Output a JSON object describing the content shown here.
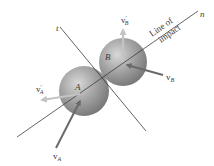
{
  "diagram": {
    "axes": {
      "n_label": "n",
      "t_label": "t",
      "line_of_impact_line1": "Line of",
      "line_of_impact_line2": "impact"
    },
    "bodies": {
      "A": {
        "label": "A",
        "color": "#8f8f8f"
      },
      "B": {
        "label": "B",
        "color": "#8f8f8f"
      }
    },
    "vectors": {
      "vA": {
        "base": "v",
        "sub": "A",
        "prime": "",
        "color": "#6a6a6a"
      },
      "vB": {
        "base": "v",
        "sub": "B",
        "prime": "",
        "color": "#6a6a6a"
      },
      "vA_prime": {
        "base": "v",
        "sub": "A",
        "prime": "′",
        "color": "#c4c4c4"
      },
      "vB_prime": {
        "base": "v",
        "sub": "B",
        "prime": "′",
        "color": "#c4c4c4"
      }
    },
    "colors": {
      "line": "#3c3c3c",
      "background": "#ffffff"
    }
  }
}
